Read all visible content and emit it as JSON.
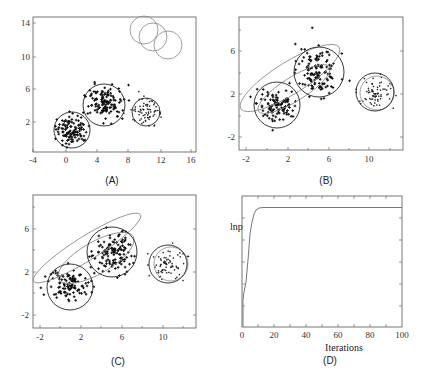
{
  "figure": {
    "panels": [
      {
        "id": "A",
        "caption": "(A)"
      },
      {
        "id": "B",
        "caption": "(B)"
      },
      {
        "id": "C",
        "caption": "(C)"
      },
      {
        "id": "D",
        "caption": "(D)"
      }
    ]
  },
  "chart_data": [
    {
      "panel": "(A)",
      "type": "scatter",
      "title": "",
      "xlabel": "",
      "ylabel": "",
      "xlim": [
        -4,
        17
      ],
      "ylim": [
        -1,
        15
      ],
      "xticks": [
        "-4",
        "0",
        "4",
        "8",
        "12",
        "16"
      ],
      "yticks": [
        "2",
        "6",
        "10",
        "14"
      ],
      "grid": false,
      "clusters": [
        {
          "center": [
            1,
            1
          ],
          "radius": 2.3,
          "style": "black circle"
        },
        {
          "center": [
            5,
            4
          ],
          "radius": 2.5,
          "style": "black circle"
        },
        {
          "center": [
            10.5,
            3
          ],
          "radius": 1.7,
          "style": "black circle"
        }
      ],
      "initial_components": [
        {
          "center": [
            10,
            13
          ],
          "radius": 1.8,
          "style": "gray circle"
        },
        {
          "center": [
            11,
            12
          ],
          "radius": 1.8,
          "style": "gray circle"
        },
        {
          "center": [
            13,
            11
          ],
          "radius": 1.8,
          "style": "gray circle"
        }
      ]
    },
    {
      "panel": "(B)",
      "type": "scatter",
      "xlim": [
        -3,
        13
      ],
      "ylim": [
        -3,
        9
      ],
      "xticks": [
        "-2",
        "2",
        "6",
        "10"
      ],
      "yticks": [
        "-2",
        "2",
        "6"
      ],
      "grid": false,
      "components": [
        {
          "center": [
            1,
            1
          ],
          "radius": 2.2,
          "style": "black circle"
        },
        {
          "center": [
            5,
            4
          ],
          "radius": 2.4,
          "style": "black circle"
        },
        {
          "center": [
            10.5,
            3
          ],
          "radius": 1.8,
          "style": "black circle"
        },
        {
          "center": [
            3,
            3
          ],
          "rx": 5.5,
          "ry": 1.6,
          "angle_deg": -32,
          "style": "gray ellipse (outer)"
        },
        {
          "center": [
            3,
            2.4
          ],
          "rx": 3.9,
          "ry": 1.2,
          "angle_deg": -32,
          "style": "gray ellipse (inner)"
        },
        {
          "center": [
            10.7,
            3
          ],
          "radius": 1.6,
          "style": "gray circle"
        }
      ]
    },
    {
      "panel": "(C)",
      "type": "scatter",
      "xlim": [
        -3,
        13
      ],
      "ylim": [
        -3,
        9
      ],
      "xticks": [
        "-2",
        "2",
        "6",
        "10"
      ],
      "yticks": [
        "-2",
        "2",
        "6"
      ],
      "grid": false,
      "components": [
        {
          "center": [
            1,
            1
          ],
          "radius": 2.2,
          "style": "black circle"
        },
        {
          "center": [
            5,
            4
          ],
          "radius": 2.4,
          "style": "black circle"
        },
        {
          "center": [
            10.5,
            3
          ],
          "radius": 1.8,
          "style": "black circle"
        },
        {
          "center": [
            3.2,
            3.6
          ],
          "rx": 6.2,
          "ry": 1.3,
          "angle_deg": -32,
          "style": "gray ellipse"
        },
        {
          "center": [
            3.5,
            2.6
          ],
          "rx": 4.2,
          "ry": 1.6,
          "angle_deg": -30,
          "style": "gray ellipse"
        },
        {
          "center": [
            10.7,
            3
          ],
          "radius": 1.6,
          "style": "gray circle"
        }
      ]
    },
    {
      "panel": "(D)",
      "type": "line",
      "xlabel": "Iterations",
      "ylabel": "lnp",
      "xlim": [
        0,
        100
      ],
      "xticks": [
        "0",
        "20",
        "40",
        "60",
        "80",
        "100"
      ],
      "yticks": [],
      "grid": false,
      "series": [
        {
          "name": "log-likelihood",
          "x": [
            0,
            0.5,
            1,
            3,
            5,
            7,
            9,
            11,
            13,
            15,
            20,
            40,
            60,
            80,
            100
          ],
          "y_relative": [
            0.0,
            0.18,
            0.25,
            0.45,
            0.65,
            0.82,
            0.92,
            0.96,
            0.975,
            0.98,
            0.98,
            0.98,
            0.98,
            0.98,
            0.98
          ]
        }
      ]
    }
  ]
}
